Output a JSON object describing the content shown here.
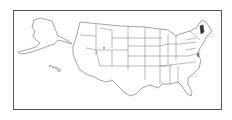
{
  "map": {
    "title": "United States map",
    "region": "USA",
    "highlighted_states": [
      {
        "name": "Vermont",
        "color": "#333333"
      },
      {
        "name": "Delaware",
        "color": "#888888"
      }
    ],
    "colors": {
      "state_fill": "#ffffff",
      "state_stroke": "#666666",
      "frame_stroke": "#555555",
      "highlight": "#333333"
    }
  }
}
